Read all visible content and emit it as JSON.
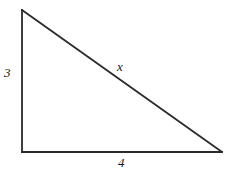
{
  "figure": {
    "type": "right-triangle-diagram",
    "background_color": "#ffffff",
    "stroke_color": "#2b2b2b",
    "stroke_width": 1.8,
    "text_color": "#1a1a1a",
    "vertices": {
      "top_left": [
        22,
        10
      ],
      "bottom_left": [
        22,
        152
      ],
      "bottom_right": [
        222,
        152
      ]
    },
    "labels": {
      "vertical_leg": "3",
      "hypotenuse": "x",
      "horizontal_leg": "4"
    }
  }
}
